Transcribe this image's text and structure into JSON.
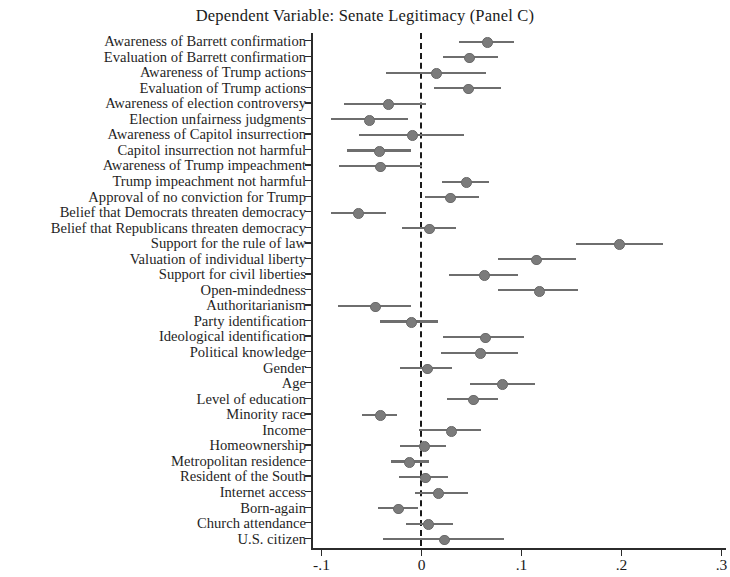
{
  "chart_data": {
    "type": "scatter",
    "subtype": "coefficient-forest-plot",
    "title": "Dependent Variable: Senate Legitimacy (Panel C)",
    "xlabel": "",
    "ylabel": "",
    "xlim": [
      -0.12,
      0.31
    ],
    "grid": false,
    "legend": null,
    "reference_line": 0,
    "reference_line_style": "dashed",
    "xticks": [
      -0.1,
      0,
      0.1,
      0.2,
      0.3
    ],
    "xtick_labels": [
      "-.1",
      "0",
      ".1",
      ".2",
      ".3"
    ],
    "categories": [
      "Awareness of Barrett confirmation",
      "Evaluation of Barrett confirmation",
      "Awareness of Trump actions",
      "Evaluation of Trump actions",
      "Awareness of election controversy",
      "Election unfairness judgments",
      "Awareness of Capitol insurrection",
      "Capitol insurrection not harmful",
      "Awareness of Trump impeachment",
      "Trump impeachment not harmful",
      "Approval of no conviction for Trump",
      "Belief that Democrats threaten democracy",
      "Belief that Republicans threaten democracy",
      "Support for the rule of law",
      "Valuation of individual liberty",
      "Support for civil liberties",
      "Open-mindedness",
      "Authoritarianism",
      "Party identification",
      "Ideological identification",
      "Political knowledge",
      "Gender",
      "Age",
      "Level of education",
      "Minority race",
      "Income",
      "Homeownership",
      "Metropolitan residence",
      "Resident of the South",
      "Internet access",
      "Born-again",
      "Church attendance",
      "U.S. citizen"
    ],
    "values": [
      0.065,
      0.047,
      0.014,
      0.046,
      -0.034,
      -0.053,
      -0.01,
      -0.043,
      -0.042,
      0.044,
      0.028,
      -0.064,
      0.007,
      0.197,
      0.114,
      0.062,
      0.117,
      -0.047,
      -0.011,
      0.063,
      0.058,
      0.005,
      0.08,
      0.051,
      -0.042,
      0.029,
      0.002,
      -0.013,
      0.003,
      0.016,
      -0.024,
      0.006,
      0.022
    ],
    "ci_low": [
      0.037,
      0.021,
      -0.036,
      0.012,
      -0.078,
      -0.091,
      -0.063,
      -0.075,
      -0.083,
      0.02,
      0.003,
      -0.091,
      -0.02,
      0.154,
      0.076,
      0.027,
      0.076,
      -0.084,
      -0.042,
      0.021,
      0.019,
      -0.022,
      0.048,
      0.025,
      -0.06,
      -0.003,
      -0.022,
      -0.031,
      -0.023,
      -0.007,
      -0.044,
      -0.016,
      -0.039
    ],
    "ci_high": [
      0.092,
      0.076,
      0.064,
      0.079,
      0.004,
      -0.014,
      0.042,
      -0.011,
      0.0,
      0.067,
      0.057,
      -0.036,
      0.034,
      0.241,
      0.154,
      0.096,
      0.156,
      -0.011,
      0.016,
      0.102,
      0.096,
      0.03,
      0.113,
      0.076,
      -0.025,
      0.059,
      0.024,
      0.007,
      0.026,
      0.046,
      -0.004,
      0.031,
      0.082
    ],
    "marker_color": "#7b7b7b",
    "line_color": "#6e6e6e",
    "axis_color": "#2b2b2b"
  },
  "axis": {
    "tick_labels": [
      "-.1",
      "0",
      ".1",
      ".2",
      ".3"
    ]
  }
}
